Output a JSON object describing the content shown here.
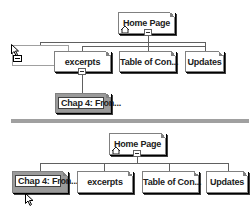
{
  "top_diagram": {
    "root": {
      "label": "Home Page",
      "icon": "home-icon"
    },
    "children": [
      {
        "label": "excerpts",
        "expanded": true
      },
      {
        "label": "Table of Con..."
      },
      {
        "label": "Updates"
      }
    ],
    "grandchild": {
      "label": "Chap 4: Fron...",
      "parent": "excerpts",
      "state": "dragging"
    }
  },
  "bottom_diagram": {
    "root": {
      "label": "Home Page",
      "icon": "home-icon"
    },
    "children": [
      {
        "label": "Chap 4: Fron...",
        "selected": true
      },
      {
        "label": "excerpts"
      },
      {
        "label": "Table of Con..."
      },
      {
        "label": "Updates"
      }
    ]
  },
  "colors": {
    "node_bg": "#ffffff",
    "selected_bg": "#9a9a9a",
    "connector": "#606060",
    "divider": "#a0a0a0"
  }
}
